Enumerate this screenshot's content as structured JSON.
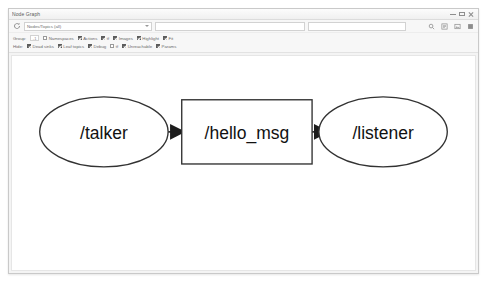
{
  "window": {
    "title": "Node Graph",
    "controls": [
      {
        "name": "minimize",
        "label": "Minimize"
      },
      {
        "name": "maximize",
        "label": "Maximize"
      },
      {
        "name": "close",
        "label": "Close"
      }
    ]
  },
  "toolbar": {
    "refresh_icon": "refresh-icon",
    "graph_type": {
      "value": "Nodes/Topics (all)",
      "options": [
        "Nodes only",
        "Nodes/Topics (active)",
        "Nodes/Topics (all)"
      ]
    },
    "namespace_filter": {
      "value": "",
      "placeholder": ""
    },
    "topic_filter": {
      "value": "",
      "placeholder": ""
    },
    "actions": [
      {
        "name": "zoom-fit-icon",
        "label": "Fit in view"
      },
      {
        "name": "save-dot-icon",
        "label": "Save as DOT"
      },
      {
        "name": "save-image-icon",
        "label": "Save as image"
      },
      {
        "name": "highlight-icon",
        "label": "Highlight connections"
      }
    ]
  },
  "filters": {
    "group_row": {
      "label": "Group:",
      "depth": "-1",
      "items": [
        {
          "label": "Namespaces",
          "checked": false
        },
        {
          "label": "Actions",
          "checked": true
        },
        {
          "label": "tf",
          "checked": true
        },
        {
          "label": "Images",
          "checked": true
        },
        {
          "label": "Highlight",
          "checked": true
        },
        {
          "label": "Fit",
          "checked": true
        }
      ]
    },
    "hide_row": {
      "label": "Hide:",
      "items": [
        {
          "label": "Dead sinks",
          "checked": true
        },
        {
          "label": "Leaf topics",
          "checked": true
        },
        {
          "label": "Debug",
          "checked": true
        },
        {
          "label": "tf",
          "checked": false
        },
        {
          "label": "Unreachable",
          "checked": true
        },
        {
          "label": "Params",
          "checked": true
        }
      ]
    }
  },
  "graph": {
    "title": "ROS computation graph",
    "nodes": [
      {
        "id": "talker",
        "label": "/talker",
        "shape": "ellipse",
        "cx": 88,
        "cy": 78,
        "rx": 66,
        "ry": 36
      },
      {
        "id": "hello_msg",
        "label": "/hello_msg",
        "shape": "rectangle",
        "x": 168,
        "y": 45,
        "w": 134,
        "h": 66
      },
      {
        "id": "listener",
        "label": "/listener",
        "shape": "ellipse",
        "cx": 375,
        "cy": 78,
        "rx": 66,
        "ry": 36
      }
    ],
    "edges": [
      {
        "from": "talker",
        "to": "hello_msg",
        "label": ""
      },
      {
        "from": "hello_msg",
        "to": "listener",
        "label": ""
      }
    ],
    "colors": {
      "node_stroke": "#323232",
      "node_fill": "#ffffff",
      "edge": "#1c1c1c",
      "label": "#111111"
    }
  }
}
